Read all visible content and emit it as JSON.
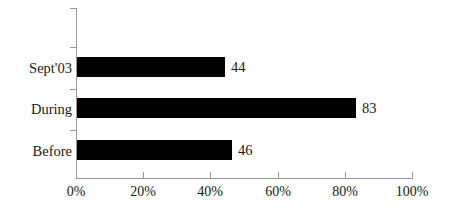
{
  "chart_data": {
    "type": "bar",
    "orientation": "horizontal",
    "title": "",
    "subtitle": "",
    "xlabel": "",
    "ylabel": "",
    "categories": [
      "Before",
      "During",
      "Sept'03"
    ],
    "values": [
      46,
      83,
      44
    ],
    "series": [
      {
        "name": "",
        "values": [
          46,
          83,
          44
        ]
      }
    ],
    "data_labels": [
      "46",
      "83",
      "44"
    ],
    "xlim": [
      0,
      100
    ],
    "xticks": [
      0,
      20,
      40,
      60,
      80,
      100
    ],
    "xtick_labels": [
      "0%",
      "20%",
      "40%",
      "60%",
      "80%",
      "100%"
    ],
    "grid": false,
    "legend": false,
    "legend_position": "none",
    "bar_color": "#000000",
    "axis_color": "#9a9a9a",
    "text_color": "#1a1a1a",
    "background_color": "#ffffff"
  },
  "bars": [
    {
      "category": "Sept'03",
      "value": 44,
      "label": "44"
    },
    {
      "category": "During",
      "value": 83,
      "label": "83"
    },
    {
      "category": "Before",
      "value": 46,
      "label": "46"
    }
  ],
  "axis": {
    "x_tick_labels": [
      "0%",
      "20%",
      "40%",
      "60%",
      "80%",
      "100%"
    ]
  }
}
